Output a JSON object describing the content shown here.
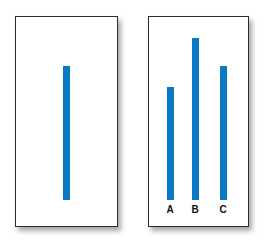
{
  "colors": {
    "bar": "#0a7ac4",
    "border": "#2b2b2b",
    "background": "#ffffff"
  },
  "left_panel": {
    "reference_line": {
      "label": ""
    }
  },
  "right_panel": {
    "bars": [
      {
        "label": "A"
      },
      {
        "label": "B"
      },
      {
        "label": "C"
      }
    ]
  }
}
